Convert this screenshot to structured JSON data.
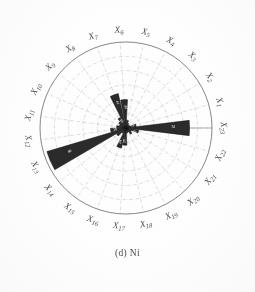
{
  "figure": {
    "caption": "(d) Ni",
    "element": "Ni",
    "panel": "(d)",
    "type": "polar-rose-diagram"
  },
  "style": {
    "bar_fill": "#2b2b2b",
    "bar_stroke": "#111111",
    "grid_color": "#9a9a9a",
    "outer_ring_color": "#6b6b6b",
    "background": "#ffffff",
    "value_label_color": "#f0f0f0"
  },
  "chart_data": {
    "type": "bar",
    "subtype": "polar-rose",
    "title": "(d) Ni",
    "xlabel": "",
    "ylabel": "",
    "grid": true,
    "legend": false,
    "angular_axis": {
      "n_sectors": 23,
      "direction": "counterclockwise",
      "start_angle_deg": 0,
      "step_deg": 15.652,
      "note": "X23 lies on the horizontal right axis; labels run counterclockwise X23, X1, X2, ... X22"
    },
    "radial_axis": {
      "rmin": 0,
      "rmax": 100,
      "n_rings": 6,
      "rings": [
        16.7,
        33.3,
        50,
        66.7,
        83.3,
        100
      ],
      "tick_labels_visible": false
    },
    "categories": [
      "X1",
      "X2",
      "X3",
      "X4",
      "X5",
      "X6",
      "X7",
      "X8",
      "X9",
      "X10",
      "X11",
      "X12",
      "X13",
      "X14",
      "X15",
      "X16",
      "X17",
      "X18",
      "X19",
      "X20",
      "X21",
      "X22",
      "X23"
    ],
    "values": [
      12,
      5,
      4,
      6,
      9,
      33,
      41,
      14,
      10,
      8,
      11,
      18,
      96,
      13,
      7,
      24,
      20,
      6,
      5,
      9,
      7,
      15,
      74
    ],
    "series": [
      {
        "name": "Ni",
        "values": [
          12,
          5,
          4,
          6,
          9,
          33,
          41,
          14,
          10,
          8,
          11,
          18,
          96,
          13,
          7,
          24,
          20,
          6,
          5,
          9,
          7,
          15,
          74
        ]
      }
    ],
    "bars": [
      {
        "axis": "X1",
        "angle_deg": 15.7,
        "value": 12,
        "label": "12"
      },
      {
        "axis": "X2",
        "angle_deg": 31.3,
        "value": 5,
        "label": ""
      },
      {
        "axis": "X3",
        "angle_deg": 47.0,
        "value": 4,
        "label": ""
      },
      {
        "axis": "X4",
        "angle_deg": 62.6,
        "value": 6,
        "label": ""
      },
      {
        "axis": "X5",
        "angle_deg": 78.3,
        "value": 9,
        "label": ""
      },
      {
        "axis": "X6",
        "angle_deg": 93.9,
        "value": 33,
        "label": "33"
      },
      {
        "axis": "X7",
        "angle_deg": 109.6,
        "value": 41,
        "label": "41"
      },
      {
        "axis": "X8",
        "angle_deg": 125.2,
        "value": 14,
        "label": "14"
      },
      {
        "axis": "X9",
        "angle_deg": 140.9,
        "value": 10,
        "label": ""
      },
      {
        "axis": "X10",
        "angle_deg": 156.5,
        "value": 8,
        "label": ""
      },
      {
        "axis": "X11",
        "angle_deg": 172.2,
        "value": 11,
        "label": ""
      },
      {
        "axis": "X12",
        "angle_deg": 187.8,
        "value": 18,
        "label": "18"
      },
      {
        "axis": "X13",
        "angle_deg": 203.5,
        "value": 96,
        "label": "96"
      },
      {
        "axis": "X14",
        "angle_deg": 219.1,
        "value": 13,
        "label": ""
      },
      {
        "axis": "X15",
        "angle_deg": 234.8,
        "value": 7,
        "label": ""
      },
      {
        "axis": "X16",
        "angle_deg": 250.4,
        "value": 24,
        "label": "24"
      },
      {
        "axis": "X17",
        "angle_deg": 266.1,
        "value": 20,
        "label": "20"
      },
      {
        "axis": "X18",
        "angle_deg": 281.7,
        "value": 6,
        "label": ""
      },
      {
        "axis": "X19",
        "angle_deg": 297.4,
        "value": 5,
        "label": ""
      },
      {
        "axis": "X20",
        "angle_deg": 313.0,
        "value": 9,
        "label": ""
      },
      {
        "axis": "X21",
        "angle_deg": 328.7,
        "value": 7,
        "label": ""
      },
      {
        "axis": "X22",
        "angle_deg": 344.3,
        "value": 15,
        "label": "15"
      },
      {
        "axis": "X23",
        "angle_deg": 0.0,
        "value": 74,
        "label": "74"
      }
    ]
  },
  "axis_labels": [
    {
      "id": "X1",
      "text": "X",
      "sub": "1"
    },
    {
      "id": "X2",
      "text": "X",
      "sub": "2"
    },
    {
      "id": "X3",
      "text": "X",
      "sub": "3"
    },
    {
      "id": "X4",
      "text": "X",
      "sub": "4"
    },
    {
      "id": "X5",
      "text": "X",
      "sub": "5"
    },
    {
      "id": "X6",
      "text": "X",
      "sub": "6"
    },
    {
      "id": "X7",
      "text": "X",
      "sub": "7"
    },
    {
      "id": "X8",
      "text": "X",
      "sub": "8"
    },
    {
      "id": "X9",
      "text": "X",
      "sub": "9"
    },
    {
      "id": "X10",
      "text": "X",
      "sub": "10"
    },
    {
      "id": "X11",
      "text": "X",
      "sub": "11"
    },
    {
      "id": "X12",
      "text": "X",
      "sub": "12"
    },
    {
      "id": "X13",
      "text": "X",
      "sub": "13"
    },
    {
      "id": "X14",
      "text": "X",
      "sub": "14"
    },
    {
      "id": "X15",
      "text": "X",
      "sub": "15"
    },
    {
      "id": "X16",
      "text": "X",
      "sub": "16"
    },
    {
      "id": "X17",
      "text": "X",
      "sub": "17"
    },
    {
      "id": "X18",
      "text": "X",
      "sub": "18"
    },
    {
      "id": "X19",
      "text": "X",
      "sub": "19"
    },
    {
      "id": "X20",
      "text": "X",
      "sub": "20"
    },
    {
      "id": "X21",
      "text": "X",
      "sub": "21"
    },
    {
      "id": "X22",
      "text": "X",
      "sub": "22"
    },
    {
      "id": "X23",
      "text": "X",
      "sub": "23"
    }
  ],
  "geometry": {
    "cx": 126,
    "cy": 128,
    "outer_radius": 86,
    "label_radius": 98
  }
}
